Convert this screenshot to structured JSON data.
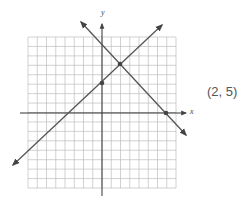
{
  "figure": {
    "axis_labels": {
      "x": "x",
      "y": "y"
    },
    "answer_label": "(2, 5)",
    "grid": {
      "left": 28,
      "top": 37,
      "right": 176,
      "bottom": 188,
      "columns": 16,
      "rows": 16,
      "color": "#bdbdbd"
    },
    "axes": {
      "origin_px": [
        102,
        113
      ],
      "color": "#333333"
    },
    "lines": [
      {
        "name": "line-increasing",
        "from": [
          13,
          165
        ],
        "to": [
          162,
          25
        ],
        "color": "#555555"
      },
      {
        "name": "line-decreasing",
        "from": [
          81,
          22
        ],
        "to": [
          186,
          135
        ],
        "color": "#555555"
      }
    ],
    "points": [
      {
        "name": "y-intercept-point",
        "px": [
          102,
          83
        ]
      },
      {
        "name": "intersection-point",
        "px": [
          120,
          64
        ]
      },
      {
        "name": "x-intercept-point",
        "px": [
          166,
          113
        ]
      }
    ]
  }
}
